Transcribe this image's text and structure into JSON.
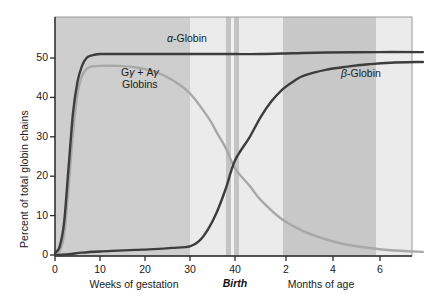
{
  "chart_data": {
    "type": "line",
    "title": "",
    "xlabel_left": "Weeks of gestation",
    "xlabel_right": "Months of age",
    "ylabel": "Percent of total globin chains",
    "birth_marker_label": "Birth",
    "ylim": [
      0,
      55
    ],
    "yticks": [
      0,
      10,
      20,
      30,
      40,
      50
    ],
    "ytick_labels": [
      "0",
      "10",
      "20",
      "30",
      "40",
      "50"
    ],
    "xticks_gestation_weeks": [
      0,
      10,
      20,
      30,
      40
    ],
    "xtick_labels_gestation": [
      "0",
      "10",
      "20",
      "30",
      "40"
    ],
    "xticks_months": [
      2,
      4,
      6
    ],
    "xtick_labels_months": [
      "2",
      "4",
      "6"
    ],
    "grid": false,
    "legend_position": "inline-annotations",
    "series": [
      {
        "name": "α-Globin",
        "label_html": "<span class=\"it\">α</span>-Globin",
        "color": "#3d3d3d",
        "annotation": "α-Globin",
        "points": [
          [
            0,
            0.5
          ],
          [
            1,
            2
          ],
          [
            2,
            8
          ],
          [
            3,
            22
          ],
          [
            4,
            36
          ],
          [
            5,
            44
          ],
          [
            6,
            48
          ],
          [
            7,
            50
          ],
          [
            8,
            50.6
          ],
          [
            10,
            51
          ],
          [
            15,
            51
          ],
          [
            20,
            51
          ],
          [
            25,
            51
          ],
          [
            30,
            51
          ],
          [
            36,
            51
          ],
          [
            40,
            51
          ],
          [
            44,
            51
          ],
          [
            50,
            51.2
          ],
          [
            56,
            51.4
          ],
          [
            66,
            51.5
          ],
          [
            74,
            51.5
          ]
        ]
      },
      {
        "name": "Gγ + Aγ Globins",
        "label_html": "G<span class=\"it\">γ</span> + A<span class=\"it\">γ</span><br>Globins",
        "color": "#a8a8a8",
        "annotation": "Gγ + Aγ Globins",
        "points": [
          [
            0,
            0.3
          ],
          [
            1,
            1
          ],
          [
            2,
            5
          ],
          [
            3,
            17
          ],
          [
            4,
            31
          ],
          [
            5,
            41
          ],
          [
            6,
            45.5
          ],
          [
            7,
            47.2
          ],
          [
            8,
            47.8
          ],
          [
            10,
            48
          ],
          [
            14,
            48
          ],
          [
            18,
            47.6
          ],
          [
            22,
            46.6
          ],
          [
            26,
            44.5
          ],
          [
            30,
            41
          ],
          [
            34,
            35
          ],
          [
            36,
            31
          ],
          [
            38,
            27
          ],
          [
            40,
            22
          ],
          [
            42,
            17.5
          ],
          [
            44,
            14
          ],
          [
            48,
            9
          ],
          [
            52,
            6
          ],
          [
            56,
            4
          ],
          [
            60,
            2.6
          ],
          [
            64,
            1.8
          ],
          [
            68,
            1.2
          ],
          [
            74,
            0.8
          ]
        ]
      },
      {
        "name": "β-Globin",
        "label_html": "<span class=\"it\">β</span>-Globin",
        "color": "#3d3d3d",
        "annotation": "β-Globin",
        "points": [
          [
            0,
            0
          ],
          [
            3,
            0.2
          ],
          [
            6,
            0.6
          ],
          [
            10,
            0.9
          ],
          [
            14,
            1.1
          ],
          [
            18,
            1.3
          ],
          [
            22,
            1.5
          ],
          [
            26,
            1.8
          ],
          [
            30,
            2.2
          ],
          [
            32,
            3.5
          ],
          [
            34,
            6.5
          ],
          [
            36,
            11
          ],
          [
            38,
            17
          ],
          [
            40,
            24
          ],
          [
            42,
            30
          ],
          [
            44,
            35
          ],
          [
            46,
            39
          ],
          [
            48,
            42
          ],
          [
            50,
            44
          ],
          [
            52,
            45.5
          ],
          [
            56,
            47
          ],
          [
            60,
            47.8
          ],
          [
            64,
            48.4
          ],
          [
            68,
            48.8
          ],
          [
            74,
            49
          ]
        ]
      }
    ],
    "background_bands": [
      {
        "from_px": 55,
        "to_px": 190,
        "color": "#cecece"
      },
      {
        "from_px": 190,
        "to_px": 226,
        "color": "#ebebeb"
      },
      {
        "from_px": 226,
        "to_px": 231,
        "color": "#c4c4c4"
      },
      {
        "from_px": 231,
        "to_px": 234,
        "color": "#f2f2f2"
      },
      {
        "from_px": 234,
        "to_px": 239,
        "color": "#c4c4c4"
      },
      {
        "from_px": 239,
        "to_px": 283,
        "color": "#ebebeb"
      },
      {
        "from_px": 283,
        "to_px": 376,
        "color": "#c8c8c8"
      },
      {
        "from_px": 376,
        "to_px": 412,
        "color": "#ebebeb"
      }
    ]
  }
}
